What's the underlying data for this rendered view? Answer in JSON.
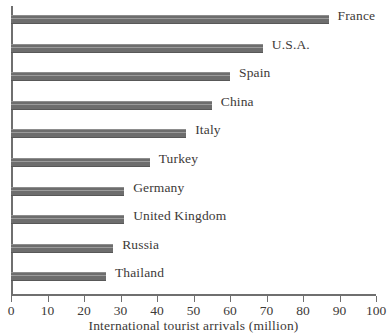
{
  "chart_data": {
    "type": "bar",
    "orientation": "horizontal",
    "title": "",
    "xlabel": "International tourist arrivals (million)",
    "ylabel": "",
    "xlim": [
      0,
      100
    ],
    "xticks": [
      0,
      10,
      20,
      30,
      40,
      50,
      60,
      70,
      80,
      90,
      100
    ],
    "xtick_labels": [
      "0",
      "10",
      "20",
      "30",
      "40",
      "50",
      "60",
      "70",
      "80",
      "90",
      "100"
    ],
    "grid": false,
    "legend": false,
    "categories": [
      "France",
      "U.S.A.",
      "Spain",
      "China",
      "Italy",
      "Turkey",
      "Germany",
      "United Kingdom",
      "Russia",
      "Thailand"
    ],
    "values": [
      87,
      69,
      60,
      55,
      48,
      38,
      31,
      31,
      28,
      26
    ],
    "bars": [
      {
        "label": "France",
        "value": 87
      },
      {
        "label": "U.S.A.",
        "value": 69
      },
      {
        "label": "Spain",
        "value": 60
      },
      {
        "label": "China",
        "value": 55
      },
      {
        "label": "Italy",
        "value": 48
      },
      {
        "label": "Turkey",
        "value": 38
      },
      {
        "label": "Germany",
        "value": 31
      },
      {
        "label": "United Kingdom",
        "value": 31
      },
      {
        "label": "Russia",
        "value": 28
      },
      {
        "label": "Thailand",
        "value": 26
      }
    ],
    "colors": {
      "bar_fill": "#6d6d6d",
      "bar_highlight": "#9b9b9b",
      "bar_shadow": "#585858",
      "axis": "#6f6f6f",
      "text": "#3d3a38",
      "background": "#ffffff"
    }
  }
}
